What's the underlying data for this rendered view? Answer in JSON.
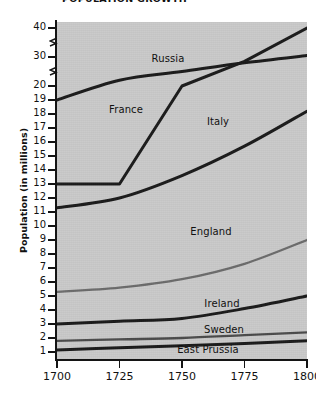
{
  "chart_data": {
    "type": "line",
    "title": "POPULATION GROWTH",
    "xlabel": "",
    "ylabel": "Population (in millions)",
    "xlim": [
      1700,
      1800
    ],
    "ylim": [
      0,
      40
    ],
    "grid": false,
    "legend_position": "inline-labels",
    "x_ticks": [
      "1700",
      "1725",
      "1750",
      "1775",
      "1800"
    ],
    "x_tick_values": [
      1700,
      1725,
      1750,
      1775,
      1800
    ],
    "y_ticks": [
      "1",
      "2",
      "3",
      "4",
      "5",
      "6",
      "7",
      "8",
      "9",
      "10",
      "11",
      "12",
      "13",
      "14",
      "15",
      "16",
      "17",
      "18",
      "19",
      "20",
      "30",
      "40"
    ],
    "y_tick_values": [
      1,
      2,
      3,
      4,
      5,
      6,
      7,
      8,
      9,
      10,
      11,
      12,
      13,
      14,
      15,
      16,
      17,
      18,
      19,
      20,
      30,
      40
    ],
    "y_axis_note": "broken axis: linear 1-20, then compressed breaks to 30 and 40",
    "x": [
      1700,
      1725,
      1750,
      1775,
      1800
    ],
    "series": [
      {
        "name": "Russia",
        "color": "#1a1a1a",
        "values": [
          19.0,
          22.0,
          25.0,
          28.0,
          30.5
        ],
        "label_x": 168,
        "label_y": 53
      },
      {
        "name": "France",
        "color": "#1a1a1a",
        "values": [
          13.0,
          13.0,
          20.0,
          28.5,
          40.0
        ],
        "label_x": 126,
        "label_y": 104
      },
      {
        "name": "Italy",
        "color": "#1a1a1a",
        "values": [
          11.3,
          12.0,
          13.6,
          15.7,
          18.2
        ],
        "label_x": 218,
        "label_y": 116
      },
      {
        "name": "England",
        "color": "#6b6b6b",
        "values": [
          5.3,
          5.6,
          6.2,
          7.3,
          9.0
        ],
        "label_x": 211,
        "label_y": 226
      },
      {
        "name": "Ireland",
        "color": "#1a1a1a",
        "values": [
          3.0,
          3.2,
          3.4,
          4.1,
          5.0
        ],
        "label_x": 222,
        "label_y": 298
      },
      {
        "name": "Sweden",
        "color": "#4a4a4a",
        "values": [
          1.8,
          1.9,
          2.0,
          2.2,
          2.4
        ],
        "label_x": 224,
        "label_y": 324
      },
      {
        "name": "East Prussia",
        "color": "#1a1a1a",
        "values": [
          1.15,
          1.3,
          1.45,
          1.6,
          1.8
        ],
        "label_x": 208,
        "label_y": 344
      }
    ],
    "colors": {
      "plot_background": "#c9c9c9",
      "page_background": "#ffffff",
      "axis": "#141414",
      "text": "#111111"
    }
  }
}
